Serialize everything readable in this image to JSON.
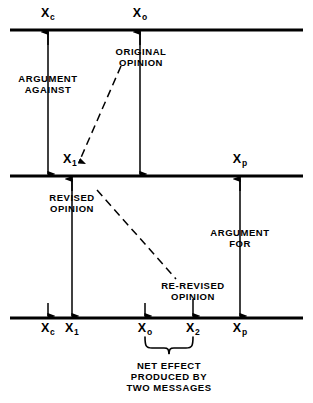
{
  "figure": {
    "type": "diagram",
    "background_color": "#ffffff",
    "ink_color": "#000000"
  },
  "scales": [
    {
      "id": "scale-top",
      "y": 30,
      "x_start": 10,
      "x_end": 303,
      "points": [
        {
          "name": "Xc",
          "base": "X",
          "sub": "c",
          "x": 48
        },
        {
          "name": "Xo",
          "base": "X",
          "sub": "o",
          "x": 140
        }
      ]
    },
    {
      "id": "scale-middle",
      "y": 176,
      "x_start": 10,
      "x_end": 303,
      "points": [
        {
          "name": "X1",
          "base": "X",
          "sub": "1",
          "x": 72
        },
        {
          "name": "Xp",
          "base": "X",
          "sub": "p",
          "x": 240
        }
      ]
    },
    {
      "id": "scale-bottom",
      "y": 318,
      "x_start": 10,
      "x_end": 303,
      "points": [
        {
          "name": "Xc",
          "base": "X",
          "sub": "c",
          "x": 48
        },
        {
          "name": "X1",
          "base": "X",
          "sub": "1",
          "x": 72
        },
        {
          "name": "Xo",
          "base": "X",
          "sub": "o",
          "x": 145
        },
        {
          "name": "X2",
          "base": "X",
          "sub": "2",
          "x": 193
        },
        {
          "name": "Xp",
          "base": "X",
          "sub": "p",
          "x": 240
        }
      ]
    }
  ],
  "labels": {
    "x_c_top": {
      "base": "X",
      "sub": "c"
    },
    "x_o_top": {
      "base": "X",
      "sub": "o"
    },
    "x_1_mid": {
      "base": "X",
      "sub": "1"
    },
    "x_p_mid": {
      "base": "X",
      "sub": "p"
    },
    "x_c_bot": {
      "base": "X",
      "sub": "c"
    },
    "x_1_bot": {
      "base": "X",
      "sub": "1"
    },
    "x_o_bot": {
      "base": "X",
      "sub": "o"
    },
    "x_2_bot": {
      "base": "X",
      "sub": "2"
    },
    "x_p_bot": {
      "base": "X",
      "sub": "p"
    }
  },
  "annotations": {
    "argument_against": {
      "line1": "ARGUMENT",
      "line2": "AGAINST"
    },
    "original_opinion": {
      "line1": "ORIGINAL",
      "line2": "OPINION"
    },
    "revised_opinion": {
      "line1": "REVISED",
      "line2": "OPINION"
    },
    "argument_for": {
      "line1": "ARGUMENT",
      "line2": "FOR"
    },
    "re_revised_opinion": {
      "line1": "RE-REVISED",
      "line2": "OPINION"
    },
    "net_effect": {
      "line1": "NET EFFECT",
      "line2": "PRODUCED BY",
      "line3": "TWO MESSAGES"
    }
  }
}
